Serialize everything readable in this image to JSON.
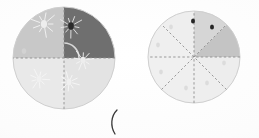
{
  "canvas": {
    "width": 259,
    "height": 138,
    "background_color": "#fdfdfd",
    "description": "Scanned worksheet page showing two shaded fraction circles"
  },
  "colors": {
    "paper": "#fdfdfd",
    "very_light_gray": "#efefef",
    "light_gray": "#e3e3e3",
    "medium_gray": "#c8c8c8",
    "mid_gray": "#bdbdbd",
    "dark_gray": "#6f6f6f",
    "darker_gray": "#5a5a5a",
    "dot_dark": "#2b2b2b",
    "dot_faint": "#dcdcdc",
    "divider": "#8e8e8e",
    "outline": "#cfcfcf",
    "ink": "#3a3a3a"
  },
  "figures": [
    {
      "id": "left-circle",
      "name": "quartered-shaded-circle",
      "center_x": 64,
      "center_y": 58,
      "radius": 51,
      "division_count": 4,
      "divider_style": "dashed",
      "sectors": [
        {
          "index": 0,
          "label": "upper-left",
          "start_deg": 180,
          "end_deg": 270,
          "fill": "#c8c8c8",
          "shaded": true
        },
        {
          "index": 1,
          "label": "upper-right",
          "start_deg": 270,
          "end_deg": 360,
          "fill": "#6f6f6f",
          "shaded": true
        },
        {
          "index": 2,
          "label": "lower-right",
          "start_deg": 0,
          "end_deg": 90,
          "fill": "#e3e3e3",
          "shaded": false
        },
        {
          "index": 3,
          "label": "lower-left",
          "start_deg": 90,
          "end_deg": 180,
          "fill": "#e9e9e9",
          "shaded": false
        }
      ],
      "arc_annotation": {
        "name": "quarter-arc-marker",
        "radius": 15,
        "start_deg": 270,
        "end_deg": 360,
        "color": "#d8d8d8"
      },
      "marks": [
        {
          "x": 44,
          "y": 24,
          "kind": "splatter",
          "size": 5,
          "color": "#ededed",
          "halo": "#f4f4f4"
        },
        {
          "x": 71,
          "y": 26,
          "kind": "splatter",
          "size": 4.5,
          "color": "#2b2b2b",
          "halo": "#e8e8e8"
        },
        {
          "x": 24,
          "y": 51,
          "kind": "dot",
          "size": 3.5,
          "color": "#d2d2d2",
          "halo": "none"
        },
        {
          "x": 83,
          "y": 60,
          "kind": "splatter",
          "size": 4,
          "color": "#ededed",
          "halo": "#f4f4f4"
        },
        {
          "x": 39,
          "y": 79,
          "kind": "splatter",
          "size": 4,
          "color": "#f0f0f0",
          "halo": "#f6f6f6"
        },
        {
          "x": 69,
          "y": 82,
          "kind": "splatter",
          "size": 4,
          "color": "#f0f0f0",
          "halo": "#f6f6f6"
        }
      ]
    },
    {
      "id": "right-circle",
      "name": "eighths-shaded-circle",
      "center_x": 194,
      "center_y": 57,
      "radius": 46,
      "division_count": 8,
      "divider_style": "dashed",
      "sectors": [
        {
          "index": 0,
          "label": "e1-right-upper",
          "start_deg": 315,
          "end_deg": 360,
          "fill": "#c4c4c4",
          "shaded": true
        },
        {
          "index": 1,
          "label": "e2-top-right",
          "start_deg": 270,
          "end_deg": 315,
          "fill": "#d6d6d6",
          "shaded": true
        },
        {
          "index": 2,
          "label": "e3-top-left",
          "start_deg": 225,
          "end_deg": 270,
          "fill": "#eeeeee",
          "shaded": false
        },
        {
          "index": 3,
          "label": "e4-left-upper",
          "start_deg": 180,
          "end_deg": 225,
          "fill": "#efefef",
          "shaded": false
        },
        {
          "index": 4,
          "label": "e5-left-lower",
          "start_deg": 135,
          "end_deg": 180,
          "fill": "#f0f0f0",
          "shaded": false
        },
        {
          "index": 5,
          "label": "e6-bottom-left",
          "start_deg": 90,
          "end_deg": 135,
          "fill": "#efefef",
          "shaded": false
        },
        {
          "index": 6,
          "label": "e7-bottom-right",
          "start_deg": 45,
          "end_deg": 90,
          "fill": "#eeeeee",
          "shaded": false
        },
        {
          "index": 7,
          "label": "e8-right-lower",
          "start_deg": 0,
          "end_deg": 45,
          "fill": "#ededed",
          "shaded": false
        }
      ],
      "marks": [
        {
          "x": 193,
          "y": 21,
          "kind": "dot",
          "size": 3.2,
          "color": "#262626",
          "halo": "none"
        },
        {
          "x": 212,
          "y": 27,
          "kind": "dot",
          "size": 3.2,
          "color": "#262626",
          "halo": "none"
        },
        {
          "x": 171,
          "y": 27,
          "kind": "dot",
          "size": 3,
          "color": "#dcdcdc",
          "halo": "none"
        },
        {
          "x": 158,
          "y": 45,
          "kind": "dot",
          "size": 3,
          "color": "#dcdcdc",
          "halo": "none"
        },
        {
          "x": 161,
          "y": 72,
          "kind": "dot",
          "size": 3,
          "color": "#dcdcdc",
          "halo": "none"
        },
        {
          "x": 186,
          "y": 88,
          "kind": "dot",
          "size": 3,
          "color": "#dcdcdc",
          "halo": "none"
        },
        {
          "x": 207,
          "y": 83,
          "kind": "dot",
          "size": 3,
          "color": "#dcdcdc",
          "halo": "none"
        },
        {
          "x": 224,
          "y": 63,
          "kind": "dot",
          "size": 3,
          "color": "#dcdcdc",
          "halo": "none"
        }
      ]
    }
  ],
  "annotations": {
    "paren_mark": {
      "name": "handwritten-open-parenthesis",
      "glyph": "(",
      "x": 113,
      "y": 122,
      "color": "#3a3a3a"
    }
  },
  "chart_data": {
    "type": "pie",
    "title": "",
    "xlabel": "",
    "ylabel": "",
    "legend_position": "none",
    "grid": false,
    "charts": [
      {
        "name": "left-circle-fourths",
        "slices": 4,
        "slice_value": 0.25,
        "categories": [
          "upper-left",
          "upper-right",
          "lower-right",
          "lower-left"
        ],
        "values": [
          0.25,
          0.25,
          0.25,
          0.25
        ],
        "shaded_count": 2,
        "shaded_fraction": "2/4",
        "shaded_decimal": 0.5
      },
      {
        "name": "right-circle-eighths",
        "slices": 8,
        "slice_value": 0.125,
        "categories": [
          "e1",
          "e2",
          "e3",
          "e4",
          "e5",
          "e6",
          "e7",
          "e8"
        ],
        "values": [
          0.125,
          0.125,
          0.125,
          0.125,
          0.125,
          0.125,
          0.125,
          0.125
        ],
        "shaded_count": 2,
        "shaded_fraction": "2/8",
        "shaded_decimal": 0.25
      }
    ]
  }
}
